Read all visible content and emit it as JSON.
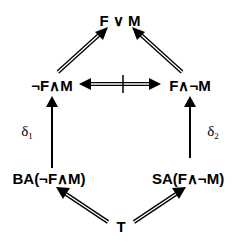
{
  "diagram": {
    "nodes": {
      "top": {
        "label": "F ∨ M"
      },
      "mid_left": {
        "label": "¬F∧M"
      },
      "mid_right": {
        "label": "F∧¬M"
      },
      "low_left": {
        "label": "BA(¬F∧M)"
      },
      "low_right": {
        "label": "SA(F∧¬M)"
      },
      "bottom": {
        "label": "T"
      }
    },
    "edge_labels": {
      "left": {
        "symbol": "δ",
        "subscript": "1"
      },
      "right": {
        "symbol": "δ",
        "subscript": "2"
      }
    },
    "edges": [
      {
        "from": "mid_left",
        "to": "top",
        "style": "double-line arrow"
      },
      {
        "from": "mid_right",
        "to": "top",
        "style": "double-line arrow"
      },
      {
        "from": "mid_left",
        "to": "mid_right",
        "style": "double-line bidirectional arrow, struck through (not equivalent)"
      },
      {
        "from": "low_left",
        "to": "mid_left",
        "style": "single arrow",
        "label": "δ1"
      },
      {
        "from": "low_right",
        "to": "mid_right",
        "style": "single arrow",
        "label": "δ2"
      },
      {
        "from": "bottom",
        "to": "low_left",
        "style": "double-line arrow"
      },
      {
        "from": "bottom",
        "to": "low_right",
        "style": "double-line arrow"
      }
    ],
    "colors": {
      "ink": "#000000",
      "background": "#ffffff"
    }
  }
}
